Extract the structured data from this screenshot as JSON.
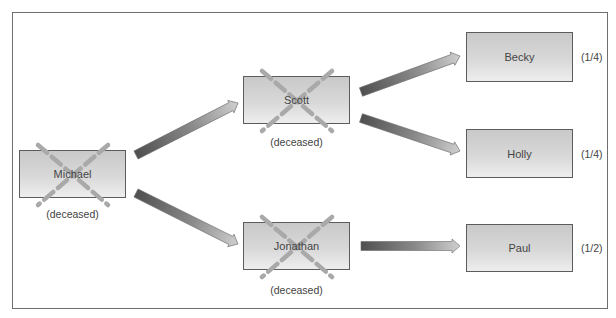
{
  "diagram": {
    "type": "inheritance-tree",
    "colors": {
      "border": "#6e6e6e",
      "node_fill_top": "#c9c9c9",
      "node_fill_bottom": "#eeeeee",
      "cross": "#a9a9a9",
      "arrow_dark": "#555555",
      "arrow_light": "#c4c4c4",
      "text": "#444444"
    },
    "nodes": [
      {
        "id": "michael",
        "name": "Michael",
        "deceased": true,
        "caption": "(deceased)",
        "share": ""
      },
      {
        "id": "scott",
        "name": "Scott",
        "deceased": true,
        "caption": "(deceased)",
        "share": ""
      },
      {
        "id": "jonathan",
        "name": "Jonathan",
        "deceased": true,
        "caption": "(deceased)",
        "share": ""
      },
      {
        "id": "becky",
        "name": "Becky",
        "deceased": false,
        "caption": "",
        "share": "(1/4)"
      },
      {
        "id": "holly",
        "name": "Holly",
        "deceased": false,
        "caption": "",
        "share": "(1/4)"
      },
      {
        "id": "paul",
        "name": "Paul",
        "deceased": false,
        "caption": "",
        "share": "(1/2)"
      }
    ],
    "edges": [
      {
        "from": "michael",
        "to": "scott"
      },
      {
        "from": "michael",
        "to": "jonathan"
      },
      {
        "from": "scott",
        "to": "becky"
      },
      {
        "from": "scott",
        "to": "holly"
      },
      {
        "from": "jonathan",
        "to": "paul"
      }
    ]
  }
}
